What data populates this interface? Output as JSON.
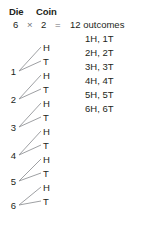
{
  "header": {
    "die_label": "Die",
    "coin_label": "Coin"
  },
  "equation": {
    "die_count": "6",
    "times_symbol": "×",
    "coin_count": "2",
    "equals_symbol": "=",
    "result": "12 outcomes"
  },
  "outcomes": [
    {
      "text": "1H, 1T"
    },
    {
      "text": "2H, 2T"
    },
    {
      "text": "3H, 3T"
    },
    {
      "text": "4H, 4T"
    },
    {
      "text": "5H, 5T"
    },
    {
      "text": "6H, 6T"
    }
  ],
  "tree": {
    "branches": [
      {
        "die": "1",
        "coin_heads": "H",
        "coin_tails": "T"
      },
      {
        "die": "2",
        "coin_heads": "H",
        "coin_tails": "T"
      },
      {
        "die": "3",
        "coin_heads": "H",
        "coin_tails": "T"
      },
      {
        "die": "4",
        "coin_heads": "H",
        "coin_tails": "T"
      },
      {
        "die": "5",
        "coin_heads": "H",
        "coin_tails": "T"
      },
      {
        "die": "6",
        "coin_heads": "H",
        "coin_tails": "T"
      }
    ],
    "line_color": "#939598"
  }
}
